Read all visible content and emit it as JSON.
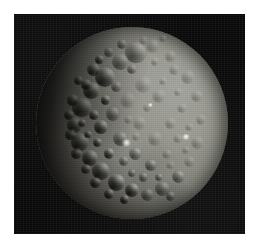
{
  "figure": {
    "name": "ceres-disc-photograph",
    "kind": "spacecraft-image",
    "caption": "",
    "page_background": "#ffffff",
    "panel": {
      "background": "#080808",
      "left": 14,
      "top": 14,
      "width": 231,
      "height": 220
    },
    "disc": {
      "center_x": 132,
      "center_y": 123,
      "diameter": 192,
      "illumination_direction": "upper-right",
      "terminator_side": "left",
      "surface_color_mid": "#8b8b84",
      "surface_color_bright": "#a2a29d",
      "shadow_color": "#14130f",
      "sky_color": "#080808",
      "facula_color": "#fffffa"
    },
    "features": {
      "faculae": [
        {
          "name": "bright-spot-primary",
          "x": 126,
          "y": 143,
          "size": 9
        },
        {
          "name": "bright-spot-secondary",
          "x": 186,
          "y": 137,
          "size": 8
        },
        {
          "name": "bright-spot-faint",
          "x": 150,
          "y": 105,
          "size": 5
        }
      ],
      "crater_count_drawn": 74
    },
    "craters": [
      {
        "x": 0.52,
        "y": 0.13,
        "r": 0.058,
        "cls": "lit"
      },
      {
        "x": 0.44,
        "y": 0.18,
        "r": 0.046,
        "cls": "lit"
      },
      {
        "x": 0.61,
        "y": 0.1,
        "r": 0.038,
        "cls": "faint"
      },
      {
        "x": 0.7,
        "y": 0.15,
        "r": 0.03,
        "cls": "faint"
      },
      {
        "x": 0.36,
        "y": 0.26,
        "r": 0.052,
        "cls": "deep"
      },
      {
        "x": 0.29,
        "y": 0.33,
        "r": 0.044,
        "cls": "deep"
      },
      {
        "x": 0.24,
        "y": 0.42,
        "r": 0.05,
        "cls": "deep"
      },
      {
        "x": 0.2,
        "y": 0.51,
        "r": 0.04,
        "cls": "deep"
      },
      {
        "x": 0.23,
        "y": 0.6,
        "r": 0.046,
        "cls": "deep"
      },
      {
        "x": 0.28,
        "y": 0.68,
        "r": 0.042,
        "cls": "deep"
      },
      {
        "x": 0.34,
        "y": 0.75,
        "r": 0.048,
        "cls": "deep"
      },
      {
        "x": 0.42,
        "y": 0.81,
        "r": 0.044,
        "cls": "deep"
      },
      {
        "x": 0.5,
        "y": 0.85,
        "r": 0.038,
        "cls": "deep"
      },
      {
        "x": 0.58,
        "y": 0.87,
        "r": 0.034,
        "cls": "lit"
      },
      {
        "x": 0.66,
        "y": 0.84,
        "r": 0.04,
        "cls": "lit"
      },
      {
        "x": 0.74,
        "y": 0.78,
        "r": 0.034,
        "cls": "lit"
      },
      {
        "x": 0.8,
        "y": 0.7,
        "r": 0.03,
        "cls": "faint"
      },
      {
        "x": 0.84,
        "y": 0.6,
        "r": 0.034,
        "cls": "faint"
      },
      {
        "x": 0.86,
        "y": 0.48,
        "r": 0.028,
        "cls": "faint"
      },
      {
        "x": 0.84,
        "y": 0.36,
        "r": 0.032,
        "cls": "faint"
      },
      {
        "x": 0.79,
        "y": 0.26,
        "r": 0.036,
        "cls": "faint"
      },
      {
        "x": 0.72,
        "y": 0.22,
        "r": 0.028,
        "cls": "faint"
      },
      {
        "x": 0.56,
        "y": 0.3,
        "r": 0.046,
        "cls": "faint"
      },
      {
        "x": 0.64,
        "y": 0.36,
        "r": 0.038,
        "cls": "faint"
      },
      {
        "x": 0.48,
        "y": 0.38,
        "r": 0.042,
        "cls": "faint"
      },
      {
        "x": 0.4,
        "y": 0.45,
        "r": 0.038,
        "cls": "lit"
      },
      {
        "x": 0.34,
        "y": 0.52,
        "r": 0.036,
        "cls": "deep"
      },
      {
        "x": 0.44,
        "y": 0.58,
        "r": 0.04,
        "cls": "lit"
      },
      {
        "x": 0.54,
        "y": 0.5,
        "r": 0.034,
        "cls": "faint"
      },
      {
        "x": 0.62,
        "y": 0.58,
        "r": 0.038,
        "cls": "faint"
      },
      {
        "x": 0.7,
        "y": 0.5,
        "r": 0.03,
        "cls": "faint"
      },
      {
        "x": 0.76,
        "y": 0.42,
        "r": 0.026,
        "cls": "faint"
      },
      {
        "x": 0.52,
        "y": 0.66,
        "r": 0.034,
        "cls": "lit"
      },
      {
        "x": 0.6,
        "y": 0.72,
        "r": 0.03,
        "cls": "lit"
      },
      {
        "x": 0.68,
        "y": 0.66,
        "r": 0.026,
        "cls": "faint"
      },
      {
        "x": 0.74,
        "y": 0.58,
        "r": 0.024,
        "cls": "faint"
      },
      {
        "x": 0.3,
        "y": 0.22,
        "r": 0.034,
        "cls": "deep"
      },
      {
        "x": 0.26,
        "y": 0.3,
        "r": 0.028,
        "cls": "deep"
      },
      {
        "x": 0.19,
        "y": 0.38,
        "r": 0.03,
        "cls": "deep"
      },
      {
        "x": 0.17,
        "y": 0.46,
        "r": 0.026,
        "cls": "deep"
      },
      {
        "x": 0.18,
        "y": 0.56,
        "r": 0.028,
        "cls": "deep"
      },
      {
        "x": 0.21,
        "y": 0.66,
        "r": 0.03,
        "cls": "deep"
      },
      {
        "x": 0.26,
        "y": 0.74,
        "r": 0.026,
        "cls": "deep"
      },
      {
        "x": 0.31,
        "y": 0.81,
        "r": 0.028,
        "cls": "deep"
      },
      {
        "x": 0.38,
        "y": 0.87,
        "r": 0.026,
        "cls": "deep"
      },
      {
        "x": 0.46,
        "y": 0.9,
        "r": 0.024,
        "cls": "deep"
      },
      {
        "x": 0.45,
        "y": 0.09,
        "r": 0.026,
        "cls": "lit"
      },
      {
        "x": 0.38,
        "y": 0.13,
        "r": 0.024,
        "cls": "lit"
      },
      {
        "x": 0.56,
        "y": 0.07,
        "r": 0.024,
        "cls": "faint"
      },
      {
        "x": 0.66,
        "y": 0.06,
        "r": 0.02,
        "cls": "faint"
      },
      {
        "x": 0.5,
        "y": 0.22,
        "r": 0.026,
        "cls": "lit"
      },
      {
        "x": 0.42,
        "y": 0.31,
        "r": 0.028,
        "cls": "lit"
      },
      {
        "x": 0.58,
        "y": 0.42,
        "r": 0.024,
        "cls": "faint"
      },
      {
        "x": 0.66,
        "y": 0.28,
        "r": 0.022,
        "cls": "faint"
      },
      {
        "x": 0.74,
        "y": 0.34,
        "r": 0.02,
        "cls": "faint"
      },
      {
        "x": 0.8,
        "y": 0.52,
        "r": 0.022,
        "cls": "faint"
      },
      {
        "x": 0.46,
        "y": 0.7,
        "r": 0.026,
        "cls": "lit"
      },
      {
        "x": 0.38,
        "y": 0.66,
        "r": 0.028,
        "cls": "deep"
      },
      {
        "x": 0.32,
        "y": 0.6,
        "r": 0.024,
        "cls": "deep"
      },
      {
        "x": 0.36,
        "y": 0.38,
        "r": 0.024,
        "cls": "deep"
      },
      {
        "x": 0.3,
        "y": 0.46,
        "r": 0.026,
        "cls": "deep"
      },
      {
        "x": 0.56,
        "y": 0.78,
        "r": 0.026,
        "cls": "lit"
      },
      {
        "x": 0.64,
        "y": 0.78,
        "r": 0.022,
        "cls": "lit"
      },
      {
        "x": 0.7,
        "y": 0.72,
        "r": 0.022,
        "cls": "faint"
      },
      {
        "x": 0.78,
        "y": 0.64,
        "r": 0.02,
        "cls": "faint"
      },
      {
        "x": 0.62,
        "y": 0.18,
        "r": 0.022,
        "cls": "faint"
      },
      {
        "x": 0.52,
        "y": 0.57,
        "r": 0.022,
        "cls": "faint"
      },
      {
        "x": 0.48,
        "y": 0.48,
        "r": 0.024,
        "cls": "faint"
      },
      {
        "x": 0.24,
        "y": 0.5,
        "r": 0.022,
        "cls": "deep"
      },
      {
        "x": 0.27,
        "y": 0.56,
        "r": 0.02,
        "cls": "deep"
      },
      {
        "x": 0.22,
        "y": 0.28,
        "r": 0.024,
        "cls": "deep"
      },
      {
        "x": 0.33,
        "y": 0.17,
        "r": 0.022,
        "cls": "deep"
      },
      {
        "x": 0.7,
        "y": 0.88,
        "r": 0.024,
        "cls": "lit"
      },
      {
        "x": 0.5,
        "y": 0.76,
        "r": 0.022,
        "cls": "lit"
      }
    ]
  }
}
